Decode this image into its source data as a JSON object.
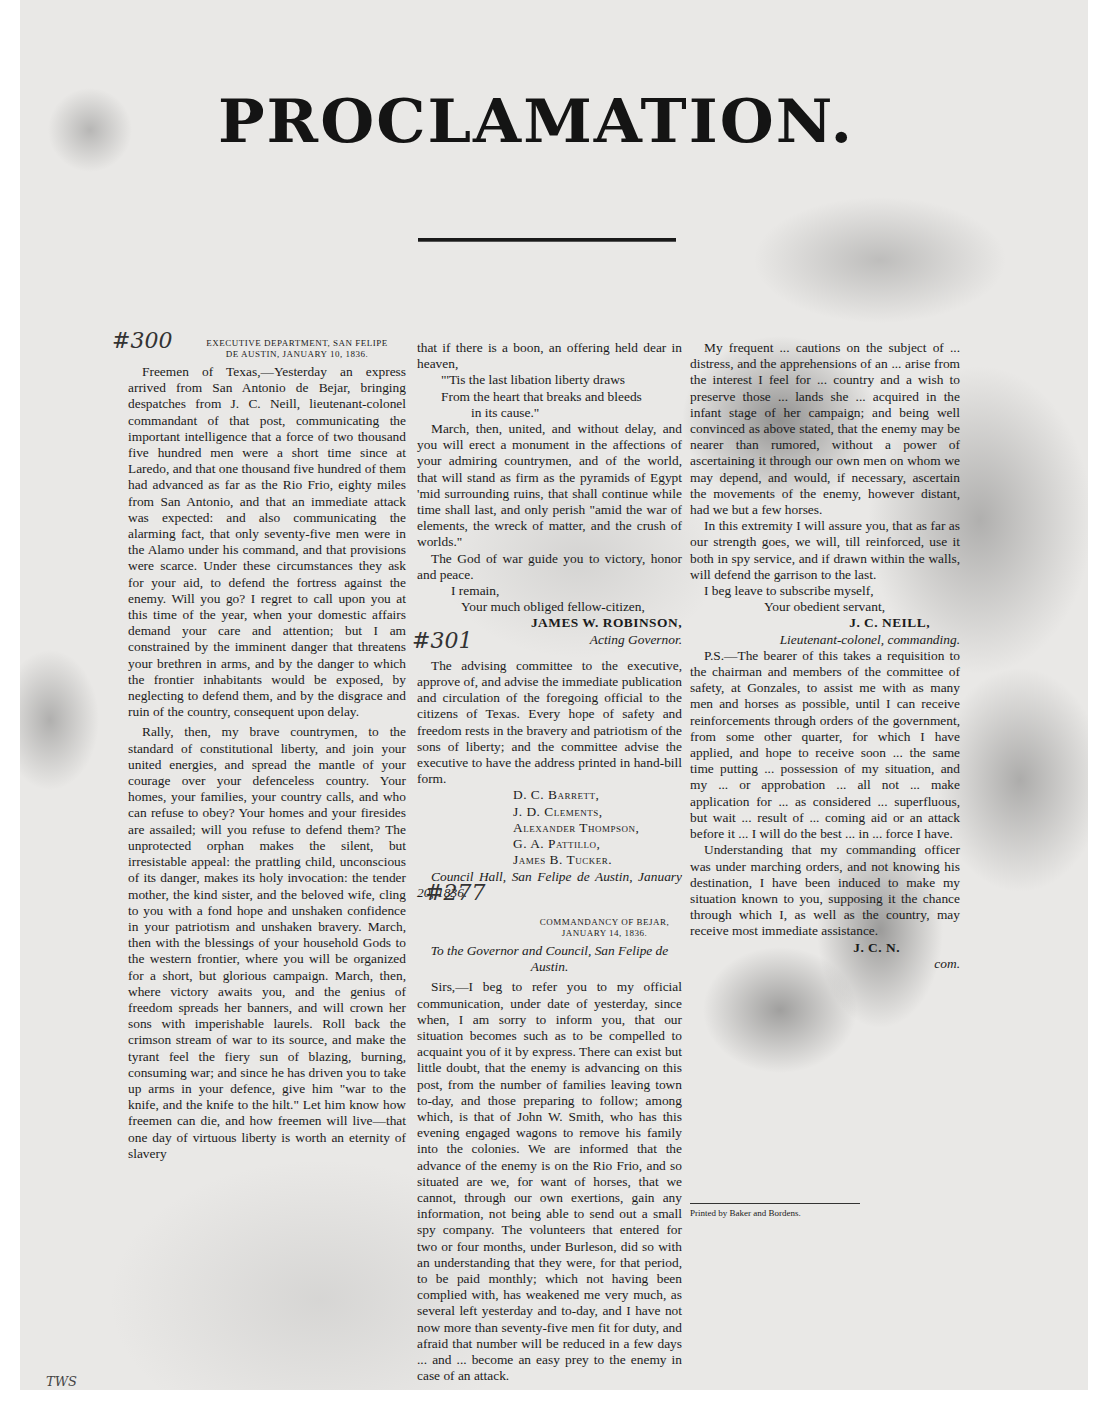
{
  "document": {
    "title": "PROCLAMATION.",
    "handwritten_marks": {
      "mark_1": "#300",
      "mark_2": "#301",
      "mark_3": "#277",
      "corner": "TWS"
    },
    "first_letter": {
      "dateline_1": "Executive Department, San Felipe",
      "dateline_2": "de Austin, January 10, 1836.",
      "paragraphs": [
        "Freemen of Texas,—Yesterday an express arrived from San Antonio de Bejar, bringing despatches from J. C. Neill, lieutenant-colonel commandant of that post, communicating the important intelligence that a force of two thousand five hundred men were a short time since at Laredo, and that one thousand five hundred of them had advanced as far as the Rio Frio, eighty miles from San Antonio, and that an immediate attack was expected: and also communicating the alarming fact, that only seventy-five men were in the Alamo under his command, and that provisions were scarce. Under these circumstances they ask for your aid, to defend the fortress against the enemy. Will you go? I regret to call upon you at this time of the year, when your domestic affairs demand your care and attention; but I am constrained by the imminent danger that threatens your brethren in arms, and by the danger to which the frontier inhabitants would be exposed, by neglecting to defend them, and by the disgrace and ruin of the country, consequent upon delay.",
        "Rally, then, my brave countrymen, to the standard of constitutional liberty, and join your united energies, and spread the mantle of your courage over your defenceless country. Your homes, your families, your country calls, and who can refuse to obey? Your homes and your firesides are assailed; will you refuse to defend them? The unprotected orphan makes the silent, but irresistable appeal: the prattling child, unconscious of its danger, makes its holy invocation: the tender mother, the kind sister, and the beloved wife, cling to you with a fond hope and unshaken confidence in your patriotism and unshaken bravery. March, then with the blessings of your household Gods to the western frontier, where you will be organized for a short, but glorious campaign. March, then, where victory awaits you, and the genius of freedom spreads her banners, and will crown her sons with imperishable laurels. Roll back the crimson stream of war to its source, and make the tyrant feel the fiery sun of blazing, burning, consuming war; and since he has driven you to take up arms in your defence, give him \"war to the knife, and the knife to the hilt.\" Let him know how freemen can die, and how freemen will live—that one day of virtuous liberty is worth an eternity of slavery"
      ],
      "continuation": "that if there is a boon, an offering held dear in heaven,",
      "poem": [
        "\"'Tis the last libation liberty draws",
        "From the heart that breaks and bleeds",
        "in its cause.\""
      ],
      "paragraphs_2": [
        "March, then, united, and without delay, and you will erect a monument in the affections of your admiring countrymen, and of the world, that will stand as firm as the pyramids of Egypt 'mid surrounding ruins, that shall continue while time shall last, and only perish \"amid the war of elements, the wreck of matter, and the crush of worlds.\"",
        "The God of war guide you to victory, honor and peace."
      ],
      "closing": "I remain,",
      "closing_2": "Your much obliged fellow-citizen,",
      "signature": "JAMES W. ROBINSON,",
      "signature_title": "Acting Governor."
    },
    "committee": {
      "text": "The advising committee to the executive, approve of, and advise the immediate publication and circulation of the foregoing official to the citizens of Texas. Every hope of safety and freedom rests in the bravery and patriotism of the sons of liberty; and the committee advise the executive to have the address printed in hand-bill form.",
      "names": [
        "D. C. Barrett,",
        "J. D. Clements,",
        "Alexander Thompson,",
        "G. A. Pattillo,",
        "James B. Tucker."
      ],
      "place_date": "Council Hall, San Felipe de Austin, January 20, 1836."
    },
    "second_letter": {
      "dateline_1": "Commandancy of Bejar,",
      "dateline_2": "January 14, 1836.",
      "address": "To the Governor and Council, San Felipe de Austin.",
      "paragraphs": [
        "Sirs,—I beg to refer you to my official communication, under date of yesterday, since when, I am sorry to inform you, that our situation becomes such as to be compelled to acquaint you of it by express. There can exist but little doubt, that the enemy is advancing on this post, from the number of families leaving town to-day, and those preparing to follow; among which, is that of John W. Smith, who has this evening engaged wagons to remove his family into the colonies. We are informed that the advance of the enemy is on the Rio Frio, and so situated are we, for want of horses, that we cannot, through our own exertions, gain any information, not being able to send out a small spy company. The volunteers that entered for two or four months, under Burleson, did so with an understanding that they were, for that period, to be paid monthly; which not having been complied with, has weakened me very much, as several left yesterday and to-day, and I have not now more than seventy-five men fit for duty, and afraid that number will be reduced in a few days ... and ... become an easy prey to the enemy in case of an attack.",
        "My frequent ... cautions on the subject of ... distress, and the apprehensions of an ... arise from the interest I feel for ... country and a wish to preserve those ... lands she ... acquired in the infant stage of her campaign; and being well convinced as above stated, that the enemy may be nearer than rumored, without a power of ascertaining it through our own men on whom we may depend, and would, if necessary, ascertain the movements of the enemy, however distant, had we but a few horses.",
        "In this extremity I will assure you, that as far as our strength goes, we will, till reinforced, use it both in spy service, and if drawn within the walls, will defend the garrison to the last."
      ],
      "closing": "I beg leave to subscribe myself,",
      "closing_2": "Your obedient servant,",
      "signature": "J. C. NEILL,",
      "signature_title": "Lieutenant-colonel, commanding.",
      "postscript": [
        "P.S.—The bearer of this takes a requisition to the chairman and members of the committee of safety, at Gonzales, to assist me with as many men and horses as possible, until I can receive reinforcements through orders of the government, from some other quarter, for which I have applied, and hope to receive soon ... the same time putting ... possession of my situation, and my ... or approbation ... all not ... make application for ... as considered ... superfluous, but wait ... result of ... coming aid or an attack before it ... I will do the best ... in ... force I have.",
        "Understanding that my commanding officer was under marching orders, and not knowing his destination, I have been induced to make my situation known to you, supposing it the chance through which I, as well as the country, may receive most immediate assistance."
      ],
      "ps_signature": "J. C. N.",
      "ps_signature_title": "com."
    },
    "printer_line": "Printed by Baker and Bordens."
  }
}
